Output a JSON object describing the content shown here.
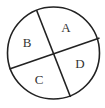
{
  "diagram": {
    "type": "circle-divided-into-four-regions",
    "stroke_color": "#222222",
    "circle": {
      "cx": 53.5,
      "cy": 53,
      "r": 46
    },
    "lines": [
      {
        "x1": 36.5,
        "y1": 10,
        "x2": 70.5,
        "y2": 97
      },
      {
        "x1": 9.5,
        "y1": 69,
        "x2": 99.5,
        "y2": 38
      }
    ],
    "regions": [
      {
        "label": "A",
        "x": 66,
        "y": 32
      },
      {
        "label": "B",
        "x": 27,
        "y": 47
      },
      {
        "label": "C",
        "x": 39,
        "y": 84
      },
      {
        "label": "D",
        "x": 80,
        "y": 68
      }
    ]
  }
}
